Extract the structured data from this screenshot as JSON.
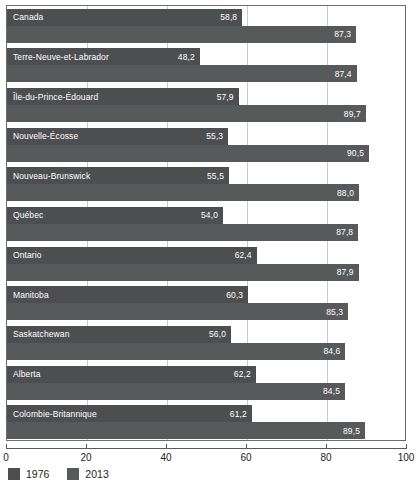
{
  "chart_data": {
    "type": "bar",
    "orientation": "horizontal",
    "title": "",
    "xlabel": "",
    "ylabel": "",
    "xlim": [
      0,
      100
    ],
    "xticks": [
      0,
      20,
      40,
      60,
      80,
      100
    ],
    "xtick_labels": [
      "0",
      "20",
      "40",
      "60",
      "80",
      "100"
    ],
    "grid": true,
    "grid_axis": "x",
    "legend_position": "bottom-left",
    "categories": [
      "Canada",
      "Terre-Neuve-et-Labrador",
      "Île-du-Prince-Édouard",
      "Nouvelle-Écosse",
      "Nouveau-Brunswick",
      "Québec",
      "Ontario",
      "Manitoba",
      "Saskatchewan",
      "Alberta",
      "Colombie-Britannique"
    ],
    "series": [
      {
        "name": "1976",
        "color": "#4d4e50",
        "values": [
          58.8,
          48.2,
          57.9,
          55.3,
          55.5,
          54.0,
          62.4,
          60.3,
          56.0,
          62.2,
          61.2
        ],
        "value_labels": [
          "58,8",
          "48,2",
          "57,9",
          "55,3",
          "55,5",
          "54,0",
          "62,4",
          "60,3",
          "56,0",
          "62,2",
          "61,2"
        ]
      },
      {
        "name": "2013",
        "color": "#58595b",
        "values": [
          87.3,
          87.4,
          89.7,
          90.5,
          88.0,
          87.8,
          87.9,
          85.3,
          84.6,
          84.5,
          89.5
        ],
        "value_labels": [
          "87,3",
          "87,4",
          "89,7",
          "90,5",
          "88,0",
          "87,8",
          "87,9",
          "85,3",
          "84,6",
          "84,5",
          "89,5"
        ]
      }
    ]
  },
  "legend": {
    "items": [
      {
        "label": "1976",
        "color": "#4d4e50"
      },
      {
        "label": "2013",
        "color": "#58595b"
      }
    ]
  }
}
